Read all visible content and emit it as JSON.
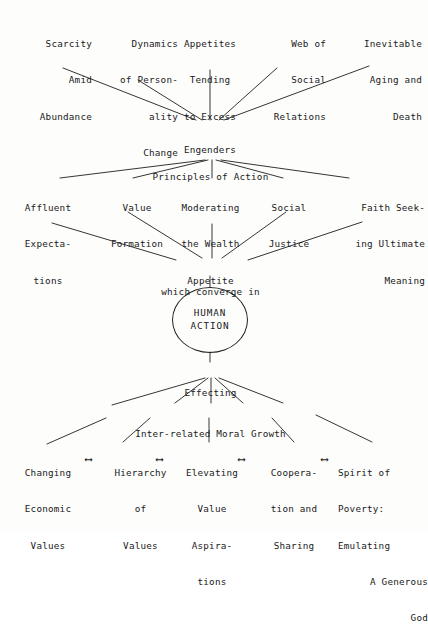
{
  "figure": {
    "ink_color": "#1a1a1a",
    "paper_color": "#fdfdfc"
  },
  "row_causes": {
    "items": [
      {
        "name": "scarcity-amid-abundance",
        "lines": [
          "Scarcity",
          "Amid",
          "Abundance"
        ]
      },
      {
        "name": "dynamics-of-personality-change",
        "lines": [
          "Dynamics",
          "of Person-",
          "ality",
          "Change"
        ]
      },
      {
        "name": "appetites-tending-to-excess",
        "lines": [
          "Appetites",
          "Tending",
          "to Excess"
        ]
      },
      {
        "name": "web-of-social-relations",
        "lines": [
          "Web of",
          "Social",
          "Relations"
        ]
      },
      {
        "name": "inevitable-aging-and-death",
        "lines": [
          "Inevitable",
          "Aging and",
          "Death"
        ]
      }
    ]
  },
  "connector_engenders": {
    "label": "Engenders"
  },
  "hub_principles": {
    "label": "Principles of Action"
  },
  "row_principles": {
    "items": [
      {
        "name": "affluent-expectations",
        "lines": [
          "Affluent",
          "Expecta-",
          "tions"
        ]
      },
      {
        "name": "value-formation",
        "lines": [
          "Value",
          "Formation"
        ]
      },
      {
        "name": "moderating-the-wealth-appetite",
        "lines": [
          "Moderating",
          "the Wealth",
          "Appetite"
        ]
      },
      {
        "name": "social-justice",
        "lines": [
          "Social",
          "Justice"
        ]
      },
      {
        "name": "faith-seeking-ultimate-meaning",
        "lines": [
          "Faith Seek-",
          "ing Ultimate",
          "Meaning"
        ]
      }
    ]
  },
  "connector_converge": {
    "label": "which converge in"
  },
  "center_node": {
    "line1": "HUMAN",
    "line2": "ACTION"
  },
  "connector_effecting": {
    "label": "Effecting"
  },
  "hub_growth": {
    "label": "Inter-related Moral Growth"
  },
  "row_growth": {
    "items": [
      {
        "name": "changing-economic-values",
        "lines": [
          "Changing",
          "Economic",
          "Values"
        ]
      },
      {
        "name": "hierarchy-of-values",
        "lines": [
          "Hierarchy",
          "of",
          "Values"
        ]
      },
      {
        "name": "elevating-value-aspirations",
        "lines": [
          "Elevating",
          "Value",
          "Aspira-",
          "tions"
        ]
      },
      {
        "name": "cooperation-and-sharing",
        "lines": [
          "Coopera-",
          "tion and",
          "Sharing"
        ]
      },
      {
        "name": "spirit-of-poverty",
        "lines": [
          "Spirit of",
          "Poverty:",
          "Emulating",
          "A Generous",
          "God"
        ]
      }
    ],
    "links": [
      {
        "name": "link-changing-to-hierarchy",
        "glyph": "⟷"
      },
      {
        "name": "link-hierarchy-to-elevating",
        "glyph": "⟷"
      },
      {
        "name": "link-elevating-to-cooperation",
        "glyph": "⟷"
      },
      {
        "name": "link-cooperation-to-spirit",
        "glyph": "⟷"
      }
    ]
  }
}
